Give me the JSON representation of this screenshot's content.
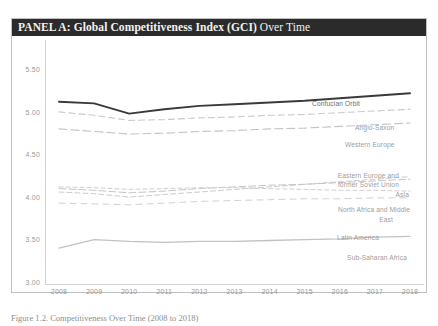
{
  "panel": {
    "title_bold": "PANEL A: Global Competitiveness Index (GCI)",
    "title_regular": " Over Time"
  },
  "caption": "Figure 1.2. Competitiveness Over Time (2008 to 2018)",
  "colors": {
    "header_bg": "#2b2b2b",
    "header_text": "#f2f2f2",
    "panel_border": "#bfbfbf",
    "axis": "#d2d2d2",
    "tick_text": "#9a9a9a",
    "label_text": "#9d9d9d",
    "series_confucian": "#3a3a3a",
    "series_anglo": "#c9c9c9",
    "series_western": "#c4c4c4",
    "series_eastern": "#cccccc",
    "series_asia": "#c6c6c6",
    "series_nam": "#cfcfcf",
    "series_latin": "#d2d2d2",
    "series_ssa": "#c2c2c2"
  },
  "chart_data": {
    "type": "line",
    "title": "PANEL A: Global Competitiveness Index (GCI) Over Time",
    "xlabel": "",
    "ylabel": "",
    "ylim": [
      3.0,
      5.5
    ],
    "yticks": [
      "5.50",
      "5.00",
      "4.50",
      "4.00",
      "3.50",
      "3.00"
    ],
    "grid": false,
    "legend": "inline-right-labels",
    "x": [
      "2008",
      "2009",
      "2010",
      "2011",
      "2012",
      "2013",
      "2014",
      "2015",
      "2016",
      "2017",
      "2018"
    ],
    "series": [
      {
        "name": "Confucian Orbit",
        "style": "solid",
        "values": [
          5.14,
          5.12,
          5.0,
          5.05,
          5.09,
          5.11,
          5.13,
          5.15,
          5.18,
          5.21,
          5.24
        ]
      },
      {
        "name": "Anglo-Saxon",
        "style": "dashed",
        "values": [
          5.02,
          4.98,
          4.92,
          4.93,
          4.95,
          4.96,
          4.98,
          4.99,
          5.01,
          5.03,
          5.05
        ]
      },
      {
        "name": "Western Europe",
        "style": "dashed",
        "values": [
          4.82,
          4.79,
          4.76,
          4.77,
          4.79,
          4.8,
          4.82,
          4.83,
          4.85,
          4.87,
          4.89
        ]
      },
      {
        "name": "Eastern Europe and former Soviet Union",
        "style": "dashed",
        "values": [
          4.08,
          4.06,
          4.02,
          4.05,
          4.08,
          4.11,
          4.14,
          4.17,
          4.2,
          4.23,
          4.26
        ]
      },
      {
        "name": "Asia",
        "style": "dashed",
        "values": [
          4.12,
          4.1,
          4.07,
          4.09,
          4.12,
          4.14,
          4.16,
          4.17,
          4.19,
          4.21,
          4.23
        ]
      },
      {
        "name": "North Africa and Middle East",
        "style": "dashed",
        "values": [
          4.14,
          4.13,
          4.11,
          4.12,
          4.13,
          4.13,
          4.12,
          4.11,
          4.1,
          4.1,
          4.09
        ]
      },
      {
        "name": "Latin America",
        "style": "dashed",
        "values": [
          3.95,
          3.94,
          3.93,
          3.95,
          3.97,
          3.98,
          3.99,
          4.0,
          4.0,
          4.01,
          4.01
        ]
      },
      {
        "name": "Sub-Saharan Africa",
        "style": "solid-light",
        "values": [
          3.42,
          3.52,
          3.5,
          3.49,
          3.5,
          3.5,
          3.51,
          3.52,
          3.53,
          3.55,
          3.56
        ]
      }
    ],
    "series_labels": [
      {
        "name": "Confucian Orbit",
        "text": "Confucian Orbit"
      },
      {
        "name": "Anglo-Saxon",
        "text": "Anglo-Saxon"
      },
      {
        "name": "Western Europe",
        "text": "Western Europe"
      },
      {
        "name": "Eastern Europe line 1",
        "text": "Eastern Europe and"
      },
      {
        "name": "Eastern Europe line 2",
        "text": "former Soviet Union"
      },
      {
        "name": "Asia",
        "text": "Asia"
      },
      {
        "name": "North Africa line 1",
        "text": "North Africa and Middle"
      },
      {
        "name": "North Africa line 2",
        "text": "East"
      },
      {
        "name": "Latin America",
        "text": "Latin America"
      },
      {
        "name": "Sub-Saharan Africa",
        "text": "Sub-Saharan Africa"
      }
    ]
  }
}
